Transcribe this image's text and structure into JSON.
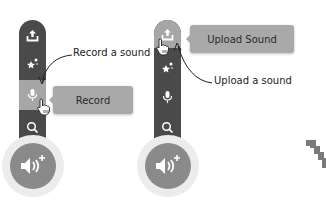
{
  "left_panel": {
    "menu_items": [
      {
        "icon": "upload-icon",
        "label": "Upload Sound"
      },
      {
        "icon": "surprise-icon",
        "label": "Surprise"
      },
      {
        "icon": "microphone-icon",
        "label": "Record"
      },
      {
        "icon": "search-icon",
        "label": "Choose a Sound"
      }
    ],
    "active_item": "Record",
    "tooltip": "Record",
    "annotation": "Record a sound",
    "main_button_icon": "add-sound-icon"
  },
  "right_panel": {
    "active_item": "Upload Sound",
    "tooltip": "Upload Sound",
    "annotation": "Upload a sound",
    "main_button_icon": "add-sound-icon"
  },
  "colors": {
    "bar": "#4a4a4a",
    "active_item": "#a6a6a6",
    "tooltip": "#a9a9a9",
    "fab": "#8a8a8a",
    "halo": "#ececec"
  }
}
